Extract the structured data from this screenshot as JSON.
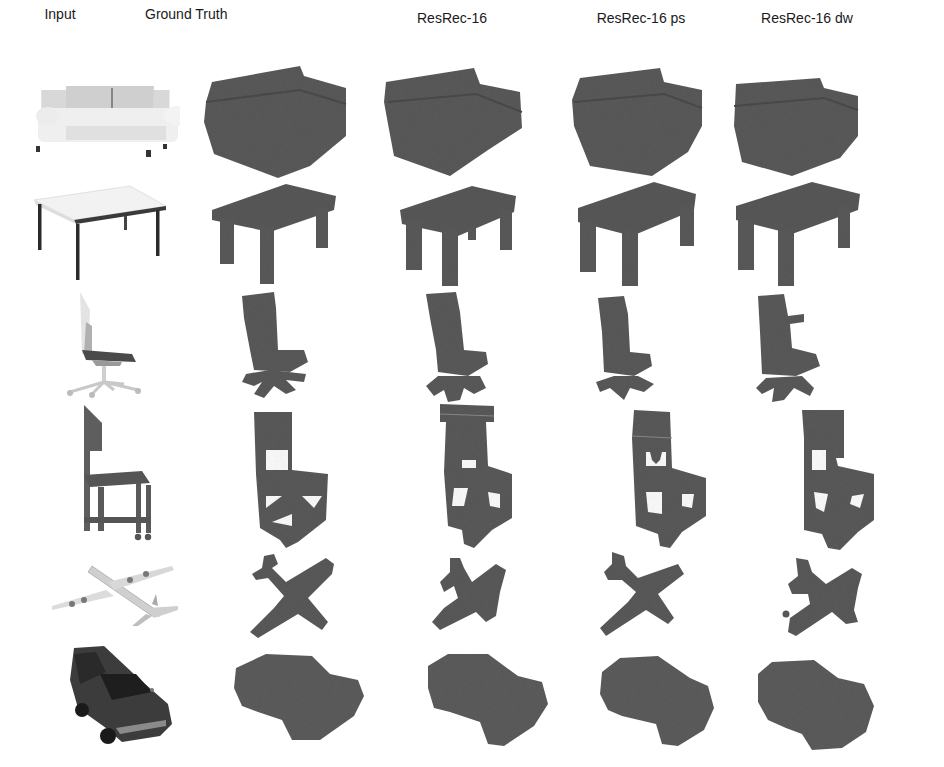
{
  "figure": {
    "columns": [
      {
        "label": "Input",
        "x": 94
      },
      {
        "label": "Ground Truth",
        "x": 276
      },
      {
        "label": "ResRec-16",
        "x": 452
      },
      {
        "label": "ResRec-16 ps",
        "x": 641
      },
      {
        "label": "ResRec-16 dw",
        "x": 807
      }
    ],
    "rows": [
      {
        "category": "sofa"
      },
      {
        "category": "table"
      },
      {
        "category": "office-chair"
      },
      {
        "category": "wooden-chair"
      },
      {
        "category": "airplane"
      },
      {
        "category": "car"
      }
    ],
    "colors": {
      "voxel": "#5b5b5b",
      "voxel_dark": "#4a4a4a",
      "input_light": "#e6e6e6",
      "input_mid": "#bdbdbd",
      "input_dark": "#2e2e2e"
    }
  }
}
